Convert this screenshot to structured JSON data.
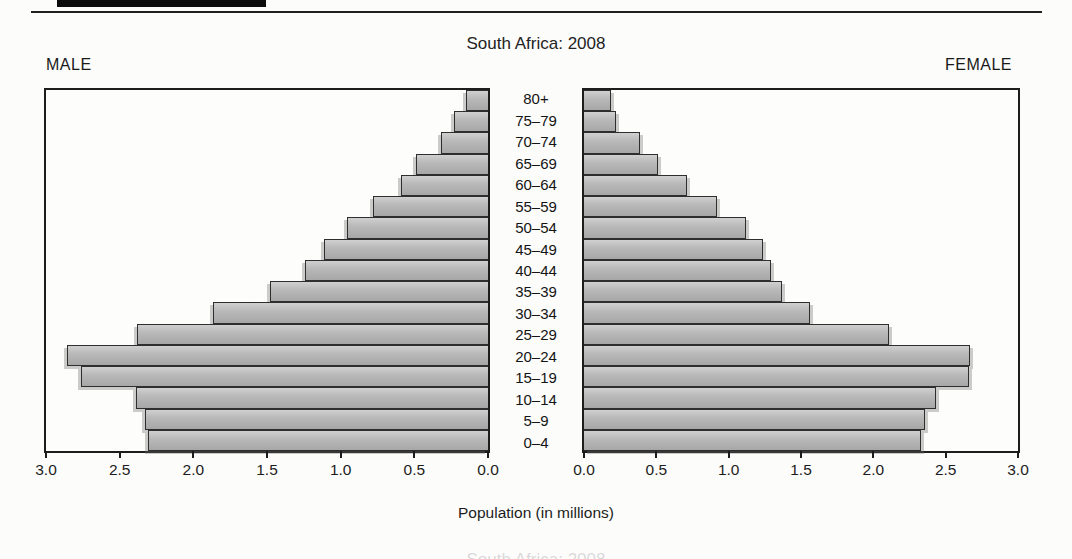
{
  "page": {
    "title": "South Africa: 2008",
    "male_label": "MALE",
    "female_label": "FEMALE",
    "xlabel": "Population (in millions)",
    "bottom_caption": "South Africa: 2008"
  },
  "chart_data": {
    "type": "bar",
    "subtype": "population-pyramid",
    "title": "South Africa: 2008",
    "xlabel": "Population (in millions)",
    "xlim": [
      0,
      3
    ],
    "grid": false,
    "legend": "none",
    "categories_top_to_bottom": [
      "80+",
      "75–79",
      "70–74",
      "65–69",
      "60–64",
      "55–59",
      "50–54",
      "45–49",
      "40–44",
      "35–39",
      "30–34",
      "25–29",
      "20–24",
      "15–19",
      "10–14",
      "5–9",
      "0–4"
    ],
    "series": [
      {
        "name": "Male",
        "values": [
          0.15,
          0.23,
          0.32,
          0.49,
          0.59,
          0.78,
          0.96,
          1.11,
          1.24,
          1.48,
          1.87,
          2.38,
          2.86,
          2.76,
          2.39,
          2.33,
          2.31
        ]
      },
      {
        "name": "Female",
        "values": [
          0.19,
          0.22,
          0.39,
          0.51,
          0.71,
          0.92,
          1.12,
          1.24,
          1.29,
          1.37,
          1.56,
          2.11,
          2.67,
          2.66,
          2.43,
          2.36,
          2.33
        ]
      }
    ],
    "xticks_male": [
      "3.0",
      "2.5",
      "2.0",
      "1.5",
      "1.0",
      "0.5",
      "0.0"
    ],
    "xticks_female": [
      "0.0",
      "0.5",
      "1.0",
      "1.5",
      "2.0",
      "2.5",
      "3.0"
    ]
  },
  "colors": {
    "bar_fill_light": "#d0d0d0",
    "bar_fill_dark": "#a7a7a7",
    "bar_border": "#2e2e2e",
    "panel_border": "#1d1d1d",
    "text": "#1c1c1c",
    "background": "#fcfcfb",
    "header_bar": "#0c0c0c"
  }
}
